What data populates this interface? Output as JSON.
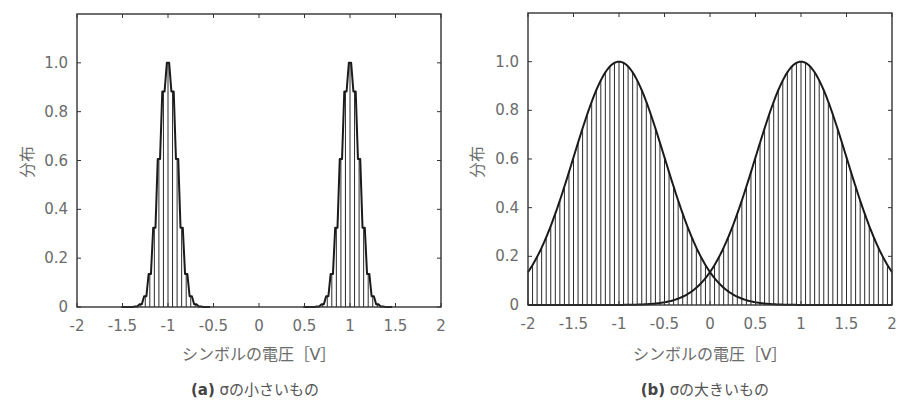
{
  "figure": {
    "panels": [
      {
        "id": "a",
        "caption_tag": "(a)",
        "caption_text": "σの小さいもの",
        "xlabel": "シンボルの電圧［V］",
        "ylabel": "分布"
      },
      {
        "id": "b",
        "caption_tag": "(b)",
        "caption_text": "σの大きいもの",
        "xlabel": "シンボルの電圧［V］",
        "ylabel": "分布"
      }
    ],
    "colors": {
      "axis": "#333333",
      "curve": "#1a1a1a",
      "bars": "#2a2a2a",
      "text": "#6b6b6b"
    }
  },
  "chart_data": [
    {
      "type": "bar",
      "title": "(a) σの小さいもの",
      "xlabel": "シンボルの電圧［V］",
      "ylabel": "分布",
      "xlim": [
        -2,
        2
      ],
      "ylim": [
        0,
        1.2
      ],
      "xticks": [
        -2,
        -1.5,
        -1,
        -0.5,
        0,
        0.5,
        1,
        1.5,
        2
      ],
      "xtick_labels": [
        "-2",
        "-1.5",
        "-1",
        "-0.5",
        "0",
        "0.5",
        "1",
        "1.5",
        "2"
      ],
      "yticks": [
        0,
        0.2,
        0.4,
        0.6,
        0.8,
        1.0
      ],
      "ytick_labels": [
        "0",
        "0.2",
        "0.4",
        "0.6",
        "0.8",
        "1.0"
      ],
      "grid": false,
      "bin_width": 0.05,
      "series": [
        {
          "name": "symbol -1",
          "mean": -1,
          "sigma": 0.1,
          "peak": 1.0,
          "x": [
            -1.3,
            -1.25,
            -1.2,
            -1.15,
            -1.1,
            -1.05,
            -1.0,
            -0.95,
            -0.9,
            -0.85,
            -0.8,
            -0.75,
            -0.7
          ],
          "values": [
            0.011,
            0.044,
            0.135,
            0.325,
            0.607,
            0.882,
            1.0,
            0.882,
            0.607,
            0.325,
            0.135,
            0.044,
            0.011
          ]
        },
        {
          "name": "symbol +1",
          "mean": 1,
          "sigma": 0.1,
          "peak": 1.0,
          "x": [
            0.7,
            0.75,
            0.8,
            0.85,
            0.9,
            0.95,
            1.0,
            1.05,
            1.1,
            1.15,
            1.2,
            1.25,
            1.3
          ],
          "values": [
            0.011,
            0.044,
            0.135,
            0.325,
            0.607,
            0.882,
            1.0,
            0.882,
            0.607,
            0.325,
            0.135,
            0.044,
            0.011
          ]
        }
      ]
    },
    {
      "type": "bar",
      "title": "(b) σの大きいもの",
      "xlabel": "シンボルの電圧［V］",
      "ylabel": "分布",
      "xlim": [
        -2,
        2
      ],
      "ylim": [
        0,
        1.2
      ],
      "xticks": [
        -2,
        -1.5,
        -1,
        -0.5,
        0,
        0.5,
        1,
        1.5,
        2
      ],
      "xtick_labels": [
        "-2",
        "-1.5",
        "-1",
        "-0.5",
        "0",
        "0.5",
        "1",
        "1.5",
        "2"
      ],
      "yticks": [
        0,
        0.2,
        0.4,
        0.6,
        0.8,
        1.0
      ],
      "ytick_labels": [
        "0",
        "0.2",
        "0.4",
        "0.6",
        "0.8",
        "1.0"
      ],
      "grid": false,
      "bin_width": 0.05,
      "series": [
        {
          "name": "symbol -1",
          "mean": -1,
          "sigma": 0.5,
          "peak": 1.0,
          "x": [
            -2,
            -1.5,
            -1,
            -0.5,
            0,
            0.5,
            1,
            1.5,
            2
          ],
          "values": [
            0.135,
            0.607,
            1.0,
            0.607,
            0.135,
            0.011,
            0.0,
            0.0,
            0.0
          ]
        },
        {
          "name": "symbol +1",
          "mean": 1,
          "sigma": 0.5,
          "peak": 1.0,
          "x": [
            -2,
            -1.5,
            -1,
            -0.5,
            0,
            0.5,
            1,
            1.5,
            2
          ],
          "values": [
            0.0,
            0.0,
            0.0,
            0.011,
            0.135,
            0.607,
            1.0,
            0.607,
            0.135
          ]
        }
      ],
      "annotations": [
        {
          "text": "curves intersect at x=0, y≈0.135"
        }
      ]
    }
  ]
}
